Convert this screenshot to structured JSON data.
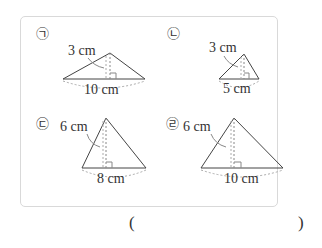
{
  "panels": [
    {
      "marker": "㉠",
      "height_label": "3 cm",
      "base_label": "10 cm"
    },
    {
      "marker": "㉡",
      "height_label": "3 cm",
      "base_label": "5 cm"
    },
    {
      "marker": "㉢",
      "height_label": "6 cm",
      "base_label": "8 cm"
    },
    {
      "marker": "㉣",
      "height_label": "6 cm",
      "base_label": "10 cm"
    }
  ],
  "answer": {
    "open_paren": "(",
    "close_paren": ")"
  }
}
